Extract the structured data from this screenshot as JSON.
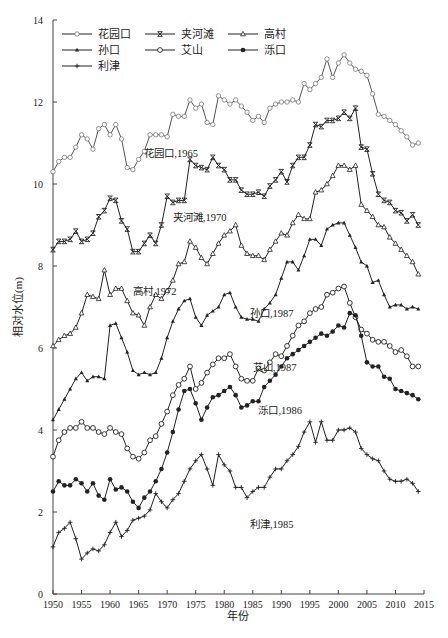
{
  "chart_data": {
    "type": "line",
    "title": "",
    "xlabel": "年份",
    "ylabel": "相对水位(m)",
    "xlim": [
      1950,
      2015
    ],
    "ylim": [
      0,
      14
    ],
    "x_ticks": [
      1950,
      1955,
      1960,
      1965,
      1970,
      1975,
      1980,
      1985,
      1990,
      1995,
      2000,
      2005,
      2010,
      2015
    ],
    "y_ticks": [
      0,
      2,
      4,
      6,
      8,
      10,
      12,
      14
    ],
    "grid": false,
    "legend_position": "top-left",
    "legend": [
      "花园口",
      "夹河滩",
      "高村",
      "孙口",
      "艾山",
      "泺口",
      "利津"
    ],
    "annotations": [
      {
        "text": "花园口,1965",
        "x": 1966,
        "y": 10.65
      },
      {
        "text": "夹河滩,1970",
        "x": 1971,
        "y": 9.1
      },
      {
        "text": "高村,1972",
        "x": 1964,
        "y": 7.3
      },
      {
        "text": "孙口,1987",
        "x": 1984.5,
        "y": 6.75
      },
      {
        "text": "艾山,1987",
        "x": 1985,
        "y": 5.45
      },
      {
        "text": "泺口,1986",
        "x": 1986,
        "y": 4.4
      },
      {
        "text": "利津,1985",
        "x": 1984.5,
        "y": 1.6
      }
    ],
    "x": [
      1950,
      1951,
      1952,
      1953,
      1954,
      1955,
      1956,
      1957,
      1958,
      1959,
      1960,
      1961,
      1962,
      1963,
      1964,
      1965,
      1966,
      1967,
      1968,
      1969,
      1970,
      1971,
      1972,
      1973,
      1974,
      1975,
      1976,
      1977,
      1978,
      1979,
      1980,
      1981,
      1982,
      1983,
      1984,
      1985,
      1986,
      1987,
      1988,
      1989,
      1990,
      1991,
      1992,
      1993,
      1994,
      1995,
      1996,
      1997,
      1998,
      1999,
      2000,
      2001,
      2002,
      2003,
      2004,
      2005,
      2006,
      2007,
      2008,
      2009,
      2010,
      2011,
      2012,
      2013,
      2014
    ],
    "series": [
      {
        "name": "花园口",
        "marker": "open-circle-small",
        "values": [
          10.3,
          10.55,
          10.65,
          10.65,
          10.9,
          11.2,
          11.1,
          10.85,
          11.35,
          11.45,
          11.2,
          11.45,
          11.1,
          10.4,
          10.35,
          10.6,
          10.8,
          11.2,
          11.2,
          11.2,
          11.15,
          11.7,
          11.65,
          11.65,
          12.05,
          11.85,
          11.95,
          11.5,
          11.45,
          12.15,
          12.05,
          11.95,
          12.05,
          11.9,
          11.75,
          11.55,
          11.65,
          11.5,
          11.85,
          11.95,
          12.0,
          12.0,
          12.05,
          12.0,
          12.45,
          12.3,
          12.45,
          12.6,
          13.05,
          12.6,
          12.95,
          13.15,
          12.95,
          12.8,
          12.75,
          12.65,
          12.2,
          11.7,
          11.65,
          11.55,
          11.45,
          11.3,
          11.15,
          10.95,
          11.0
        ]
      },
      {
        "name": "夹河滩",
        "marker": "x-cross",
        "values": [
          8.4,
          8.6,
          8.6,
          8.65,
          8.85,
          8.6,
          8.65,
          8.8,
          9.2,
          9.35,
          9.65,
          9.6,
          9.1,
          8.9,
          8.35,
          8.35,
          8.55,
          8.75,
          8.55,
          9.0,
          9.7,
          9.55,
          9.6,
          9.6,
          10.6,
          10.45,
          10.4,
          10.35,
          10.65,
          10.45,
          10.35,
          10.1,
          10.1,
          9.85,
          9.75,
          9.75,
          9.8,
          9.7,
          9.95,
          10.1,
          10.3,
          10.05,
          10.45,
          10.65,
          10.65,
          10.95,
          11.45,
          11.4,
          11.55,
          11.55,
          11.6,
          11.75,
          11.6,
          11.85,
          10.9,
          10.85,
          10.25,
          9.75,
          9.6,
          9.55,
          9.35,
          9.3,
          9.1,
          9.25,
          9.0
        ]
      },
      {
        "name": "高村",
        "marker": "open-triangle",
        "values": [
          6.05,
          6.2,
          6.3,
          6.35,
          6.5,
          6.85,
          7.3,
          7.25,
          7.2,
          7.9,
          7.3,
          7.45,
          7.45,
          7.15,
          6.85,
          6.8,
          6.55,
          7.0,
          7.3,
          7.2,
          7.4,
          7.65,
          8.05,
          8.1,
          8.6,
          8.45,
          8.2,
          8.05,
          8.3,
          8.55,
          8.75,
          8.85,
          9.0,
          8.5,
          8.3,
          8.25,
          8.25,
          8.15,
          8.4,
          8.6,
          8.8,
          8.75,
          9.05,
          9.25,
          9.15,
          9.15,
          9.8,
          9.85,
          10.0,
          10.2,
          10.45,
          10.45,
          10.35,
          10.45,
          9.5,
          9.35,
          9.2,
          9.0,
          8.95,
          8.7,
          8.55,
          8.4,
          8.25,
          8.1,
          7.8
        ]
      },
      {
        "name": "孙口",
        "marker": "filled-triangle-small",
        "values": [
          4.25,
          4.5,
          4.75,
          5.0,
          5.25,
          5.4,
          5.2,
          5.3,
          5.3,
          5.25,
          6.55,
          6.6,
          6.25,
          5.9,
          5.45,
          5.35,
          5.4,
          5.35,
          5.4,
          5.75,
          6.25,
          6.65,
          6.95,
          7.15,
          7.2,
          6.75,
          6.55,
          6.8,
          6.9,
          7.0,
          7.3,
          7.35,
          7.0,
          6.75,
          6.7,
          6.7,
          6.65,
          6.95,
          7.1,
          7.3,
          7.7,
          8.1,
          8.1,
          7.9,
          8.25,
          8.65,
          8.65,
          8.5,
          8.9,
          9.0,
          9.05,
          9.05,
          8.75,
          8.45,
          8.1,
          8.0,
          7.6,
          7.65,
          7.3,
          7.0,
          7.05,
          7.05,
          6.95,
          7.0,
          6.95
        ]
      },
      {
        "name": "艾山",
        "marker": "open-circle",
        "values": [
          3.35,
          3.75,
          3.95,
          4.05,
          4.05,
          4.2,
          4.05,
          4.05,
          3.95,
          3.9,
          4.05,
          3.95,
          3.9,
          3.55,
          3.35,
          3.3,
          3.45,
          3.75,
          3.85,
          4.15,
          4.45,
          4.85,
          5.1,
          5.25,
          5.55,
          5.0,
          5.15,
          5.4,
          5.6,
          5.75,
          5.75,
          5.85,
          5.55,
          5.25,
          5.2,
          5.2,
          5.5,
          5.45,
          5.65,
          5.85,
          5.8,
          6.05,
          6.3,
          6.55,
          6.65,
          6.85,
          6.95,
          7.0,
          7.3,
          7.35,
          7.45,
          7.5,
          7.1,
          6.75,
          6.45,
          6.35,
          6.2,
          6.15,
          6.15,
          6.05,
          5.9,
          5.95,
          5.8,
          5.55,
          5.55
        ]
      },
      {
        "name": "泺口",
        "marker": "filled-circle",
        "values": [
          2.5,
          2.75,
          2.65,
          2.65,
          2.8,
          2.7,
          2.5,
          2.7,
          2.4,
          2.3,
          2.8,
          2.55,
          2.6,
          2.5,
          2.25,
          2.1,
          2.35,
          2.5,
          2.75,
          3.05,
          3.45,
          3.95,
          4.5,
          4.95,
          5.0,
          4.65,
          4.25,
          4.55,
          4.8,
          4.85,
          4.95,
          5.05,
          4.85,
          4.55,
          4.6,
          4.7,
          4.7,
          5.05,
          5.2,
          5.35,
          5.55,
          5.75,
          5.85,
          5.95,
          6.05,
          6.15,
          6.25,
          6.35,
          6.3,
          6.4,
          6.55,
          6.5,
          6.85,
          6.8,
          6.3,
          5.65,
          5.55,
          5.55,
          5.3,
          5.25,
          5.0,
          4.95,
          4.9,
          4.85,
          4.75
        ]
      },
      {
        "name": "利津",
        "marker": "plus",
        "values": [
          1.15,
          1.5,
          1.6,
          1.75,
          1.35,
          0.85,
          1.0,
          1.1,
          1.05,
          1.2,
          1.5,
          1.75,
          1.4,
          1.55,
          1.8,
          1.85,
          1.9,
          2.05,
          2.45,
          2.25,
          2.1,
          2.3,
          2.45,
          2.75,
          3.05,
          3.25,
          3.4,
          3.05,
          2.65,
          3.4,
          3.15,
          3.0,
          2.6,
          2.6,
          2.35,
          2.5,
          2.6,
          2.6,
          2.85,
          3.05,
          3.05,
          3.25,
          3.4,
          3.6,
          3.95,
          4.2,
          3.7,
          4.2,
          3.75,
          3.75,
          4.0,
          4.0,
          4.05,
          3.95,
          3.55,
          3.4,
          3.3,
          3.25,
          3.0,
          2.8,
          2.75,
          2.75,
          2.8,
          2.7,
          2.5
        ]
      }
    ]
  }
}
